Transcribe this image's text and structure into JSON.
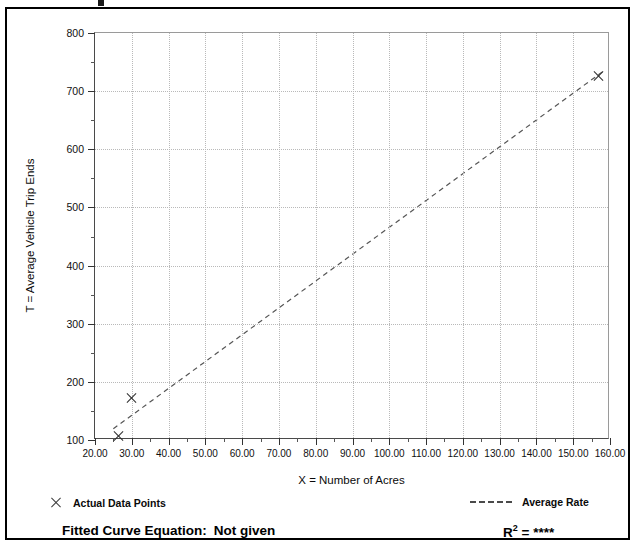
{
  "chart_data": {
    "type": "scatter",
    "title": "",
    "xlabel": "X = Number of Acres",
    "ylabel": "T = Average Vehicle Trip Ends",
    "xlim": [
      20,
      160
    ],
    "ylim": [
      100,
      800
    ],
    "x_tick_step": 10,
    "y_tick_step": 100,
    "x_minor_step": 5,
    "y_minor_step": 50,
    "x_tick_labels": [
      "20.00",
      "30.00",
      "40.00",
      "50.00",
      "60.00",
      "70.00",
      "80.00",
      "90.00",
      "100.00",
      "110.00",
      "120.00",
      "130.00",
      "140.00",
      "150.00",
      "160.00"
    ],
    "y_tick_labels": [
      "100",
      "200",
      "300",
      "400",
      "500",
      "600",
      "700",
      "800"
    ],
    "grid": true,
    "legend_position": "below-plot",
    "series": [
      {
        "name": "Actual Data Points",
        "type": "scatter",
        "marker": "x",
        "points": [
          {
            "x": 26.3,
            "y": 107
          },
          {
            "x": 29.8,
            "y": 172
          },
          {
            "x": 157.0,
            "y": 726
          }
        ]
      },
      {
        "name": "Average Rate",
        "type": "line",
        "style": "dashed",
        "points": [
          {
            "x": 25.0,
            "y": 116
          },
          {
            "x": 158.5,
            "y": 733
          }
        ]
      }
    ],
    "annotations": {
      "fitted_curve_label": "Fitted Curve Equation:",
      "fitted_curve_value": "Not given",
      "r_squared_label": "R",
      "r_squared_exponent": "2",
      "r_squared_equals": "=",
      "r_squared_value": "****"
    }
  },
  "legend": {
    "items": [
      {
        "marker": "x-marker",
        "label": "Actual Data Points"
      },
      {
        "marker": "dashed-line",
        "label": "Average Rate"
      }
    ]
  },
  "colors": {
    "frame": "#000000",
    "axis": "#333333",
    "grid": "#b9b9b9",
    "marker": "#2b2b2b",
    "trendline": "#555555",
    "text": "#0a0a0a"
  }
}
